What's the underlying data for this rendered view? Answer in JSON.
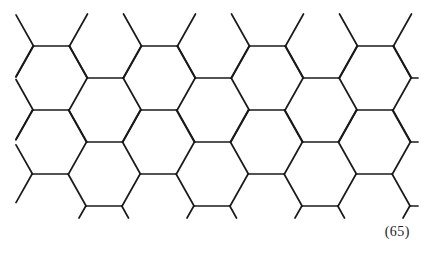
{
  "figure": {
    "label": "(65)",
    "line_color": "#1a1a1a",
    "background_color": "#ffffff"
  }
}
